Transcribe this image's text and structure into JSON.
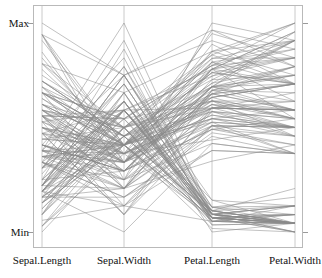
{
  "figure": {
    "title": "",
    "background_color": "#ffffff",
    "line_color": "#8a8a8a",
    "frame_color": "#b9b9b9",
    "axis_color": "#bdbdbd",
    "text_color": "#111111"
  },
  "axis_labels": {
    "max": "Max",
    "min": "Min"
  },
  "chart_data": {
    "type": "line",
    "subtype": "parallel-coordinates",
    "title": "",
    "xlabel": "",
    "ylabel": "",
    "grid": false,
    "legend": "none",
    "n_records": 150,
    "dimensions": [
      "Sepal.Length",
      "Sepal.Width",
      "Petal.Length",
      "Petal.Width"
    ],
    "axis_tick_labels": [
      "Min",
      "Max"
    ],
    "ylim": [
      0,
      1
    ],
    "note": "Each polyline is one Iris flower; values normalized per-axis to [Min,Max].",
    "dimension_ranges": [
      {
        "name": "Sepal.Length",
        "min": 4.3,
        "max": 7.9
      },
      {
        "name": "Sepal.Width",
        "min": 2.0,
        "max": 4.4
      },
      {
        "name": "Petal.Length",
        "min": 1.0,
        "max": 6.9
      },
      {
        "name": "Petal.Width",
        "min": 0.1,
        "max": 2.5
      }
    ],
    "records": [
      [
        5.1,
        3.5,
        1.4,
        0.2
      ],
      [
        4.9,
        3.0,
        1.4,
        0.2
      ],
      [
        4.7,
        3.2,
        1.3,
        0.2
      ],
      [
        4.6,
        3.1,
        1.5,
        0.2
      ],
      [
        5.0,
        3.6,
        1.4,
        0.2
      ],
      [
        5.4,
        3.9,
        1.7,
        0.4
      ],
      [
        4.6,
        3.4,
        1.4,
        0.3
      ],
      [
        5.0,
        3.4,
        1.5,
        0.2
      ],
      [
        4.4,
        2.9,
        1.4,
        0.2
      ],
      [
        4.9,
        3.1,
        1.5,
        0.1
      ],
      [
        5.4,
        3.7,
        1.5,
        0.2
      ],
      [
        4.8,
        3.4,
        1.6,
        0.2
      ],
      [
        4.8,
        3.0,
        1.4,
        0.1
      ],
      [
        4.3,
        3.0,
        1.1,
        0.1
      ],
      [
        5.8,
        4.0,
        1.2,
        0.2
      ],
      [
        5.7,
        4.4,
        1.5,
        0.4
      ],
      [
        5.4,
        3.9,
        1.3,
        0.4
      ],
      [
        5.1,
        3.5,
        1.4,
        0.3
      ],
      [
        5.7,
        3.8,
        1.7,
        0.3
      ],
      [
        5.1,
        3.8,
        1.5,
        0.3
      ],
      [
        5.4,
        3.4,
        1.7,
        0.2
      ],
      [
        5.1,
        3.7,
        1.5,
        0.4
      ],
      [
        4.6,
        3.6,
        1.0,
        0.2
      ],
      [
        5.1,
        3.3,
        1.7,
        0.5
      ],
      [
        4.8,
        3.4,
        1.9,
        0.2
      ],
      [
        5.0,
        3.0,
        1.6,
        0.2
      ],
      [
        5.0,
        3.4,
        1.6,
        0.4
      ],
      [
        5.2,
        3.5,
        1.5,
        0.2
      ],
      [
        5.2,
        3.4,
        1.4,
        0.2
      ],
      [
        4.7,
        3.2,
        1.6,
        0.2
      ],
      [
        4.8,
        3.1,
        1.6,
        0.2
      ],
      [
        5.4,
        3.4,
        1.5,
        0.4
      ],
      [
        5.2,
        4.1,
        1.5,
        0.1
      ],
      [
        5.5,
        4.2,
        1.4,
        0.2
      ],
      [
        4.9,
        3.1,
        1.5,
        0.2
      ],
      [
        5.0,
        3.2,
        1.2,
        0.2
      ],
      [
        5.5,
        3.5,
        1.3,
        0.2
      ],
      [
        4.9,
        3.6,
        1.4,
        0.1
      ],
      [
        4.4,
        3.0,
        1.3,
        0.2
      ],
      [
        5.1,
        3.4,
        1.5,
        0.2
      ],
      [
        5.0,
        3.5,
        1.3,
        0.3
      ],
      [
        4.5,
        2.3,
        1.3,
        0.3
      ],
      [
        4.4,
        3.2,
        1.3,
        0.2
      ],
      [
        5.0,
        3.5,
        1.6,
        0.6
      ],
      [
        5.1,
        3.8,
        1.9,
        0.4
      ],
      [
        4.8,
        3.0,
        1.4,
        0.3
      ],
      [
        5.1,
        3.8,
        1.6,
        0.2
      ],
      [
        4.6,
        3.2,
        1.4,
        0.2
      ],
      [
        5.3,
        3.7,
        1.5,
        0.2
      ],
      [
        5.0,
        3.3,
        1.4,
        0.2
      ],
      [
        7.0,
        3.2,
        4.7,
        1.4
      ],
      [
        6.4,
        3.2,
        4.5,
        1.5
      ],
      [
        6.9,
        3.1,
        4.9,
        1.5
      ],
      [
        5.5,
        2.3,
        4.0,
        1.3
      ],
      [
        6.5,
        2.8,
        4.6,
        1.5
      ],
      [
        5.7,
        2.8,
        4.5,
        1.3
      ],
      [
        6.3,
        3.3,
        4.7,
        1.6
      ],
      [
        4.9,
        2.4,
        3.3,
        1.0
      ],
      [
        6.6,
        2.9,
        4.6,
        1.3
      ],
      [
        5.2,
        2.7,
        3.9,
        1.4
      ],
      [
        5.0,
        2.0,
        3.5,
        1.0
      ],
      [
        5.9,
        3.0,
        4.2,
        1.5
      ],
      [
        6.0,
        2.2,
        4.0,
        1.0
      ],
      [
        6.1,
        2.9,
        4.7,
        1.4
      ],
      [
        5.6,
        2.9,
        3.6,
        1.3
      ],
      [
        6.7,
        3.1,
        4.4,
        1.4
      ],
      [
        5.6,
        3.0,
        4.5,
        1.5
      ],
      [
        5.8,
        2.7,
        4.1,
        1.0
      ],
      [
        6.2,
        2.2,
        4.5,
        1.5
      ],
      [
        5.6,
        2.5,
        3.9,
        1.1
      ],
      [
        5.9,
        3.2,
        4.8,
        1.8
      ],
      [
        6.1,
        2.8,
        4.0,
        1.3
      ],
      [
        6.3,
        2.5,
        4.9,
        1.5
      ],
      [
        6.1,
        2.8,
        4.7,
        1.2
      ],
      [
        6.4,
        2.9,
        4.3,
        1.3
      ],
      [
        6.6,
        3.0,
        4.4,
        1.4
      ],
      [
        6.8,
        2.8,
        4.8,
        1.4
      ],
      [
        6.7,
        3.0,
        5.0,
        1.7
      ],
      [
        6.0,
        2.9,
        4.5,
        1.5
      ],
      [
        5.7,
        2.6,
        3.5,
        1.0
      ],
      [
        5.5,
        2.4,
        3.8,
        1.1
      ],
      [
        5.5,
        2.4,
        3.7,
        1.0
      ],
      [
        5.8,
        2.7,
        3.9,
        1.2
      ],
      [
        6.0,
        2.7,
        5.1,
        1.6
      ],
      [
        5.4,
        3.0,
        4.5,
        1.5
      ],
      [
        6.0,
        3.4,
        4.5,
        1.6
      ],
      [
        6.7,
        3.1,
        4.7,
        1.5
      ],
      [
        6.3,
        2.3,
        4.4,
        1.3
      ],
      [
        5.6,
        3.0,
        4.1,
        1.3
      ],
      [
        5.5,
        2.5,
        4.0,
        1.3
      ],
      [
        5.5,
        2.6,
        4.4,
        1.2
      ],
      [
        6.1,
        3.0,
        4.6,
        1.4
      ],
      [
        5.8,
        2.6,
        4.0,
        1.2
      ],
      [
        5.0,
        2.3,
        3.3,
        1.0
      ],
      [
        5.6,
        2.7,
        4.2,
        1.3
      ],
      [
        5.7,
        3.0,
        4.2,
        1.2
      ],
      [
        5.7,
        2.9,
        4.2,
        1.3
      ],
      [
        6.2,
        2.9,
        4.3,
        1.3
      ],
      [
        5.1,
        2.5,
        3.0,
        1.1
      ],
      [
        5.7,
        2.8,
        4.1,
        1.3
      ],
      [
        6.3,
        3.3,
        6.0,
        2.5
      ],
      [
        5.8,
        2.7,
        5.1,
        1.9
      ],
      [
        7.1,
        3.0,
        5.9,
        2.1
      ],
      [
        6.3,
        2.9,
        5.6,
        1.8
      ],
      [
        6.5,
        3.0,
        5.8,
        2.2
      ],
      [
        7.6,
        3.0,
        6.6,
        2.1
      ],
      [
        4.9,
        2.5,
        4.5,
        1.7
      ],
      [
        7.3,
        2.9,
        6.3,
        1.8
      ],
      [
        6.7,
        2.5,
        5.8,
        1.8
      ],
      [
        7.2,
        3.6,
        6.1,
        2.5
      ],
      [
        6.5,
        3.2,
        5.1,
        2.0
      ],
      [
        6.4,
        2.7,
        5.3,
        1.9
      ],
      [
        6.8,
        3.0,
        5.5,
        2.1
      ],
      [
        5.7,
        2.5,
        5.0,
        2.0
      ],
      [
        5.8,
        2.8,
        5.1,
        2.4
      ],
      [
        6.4,
        3.2,
        5.3,
        2.3
      ],
      [
        6.5,
        3.0,
        5.5,
        1.8
      ],
      [
        7.7,
        3.8,
        6.7,
        2.2
      ],
      [
        7.7,
        2.6,
        6.9,
        2.3
      ],
      [
        6.0,
        2.2,
        5.0,
        1.5
      ],
      [
        6.9,
        3.2,
        5.7,
        2.3
      ],
      [
        5.6,
        2.8,
        4.9,
        2.0
      ],
      [
        7.7,
        2.8,
        6.7,
        2.0
      ],
      [
        6.3,
        2.7,
        4.9,
        1.8
      ],
      [
        6.7,
        3.3,
        5.7,
        2.1
      ],
      [
        7.2,
        3.2,
        6.0,
        1.8
      ],
      [
        6.2,
        2.8,
        4.8,
        1.8
      ],
      [
        6.1,
        3.0,
        4.9,
        1.8
      ],
      [
        6.4,
        2.8,
        5.6,
        2.1
      ],
      [
        7.2,
        3.0,
        5.8,
        1.6
      ],
      [
        7.4,
        2.8,
        6.1,
        1.9
      ],
      [
        7.9,
        3.8,
        6.4,
        2.0
      ],
      [
        6.4,
        2.8,
        5.6,
        2.2
      ],
      [
        6.3,
        2.8,
        5.1,
        1.5
      ],
      [
        6.1,
        2.6,
        5.6,
        1.4
      ],
      [
        7.7,
        3.0,
        6.1,
        2.3
      ],
      [
        6.3,
        3.4,
        5.6,
        2.4
      ],
      [
        6.4,
        3.1,
        5.5,
        1.8
      ],
      [
        6.0,
        3.0,
        4.8,
        1.8
      ],
      [
        6.9,
        3.1,
        5.4,
        2.1
      ],
      [
        6.7,
        3.1,
        5.6,
        2.4
      ],
      [
        6.9,
        3.1,
        5.1,
        2.3
      ],
      [
        5.8,
        2.7,
        5.1,
        1.9
      ],
      [
        6.8,
        3.2,
        5.9,
        2.3
      ],
      [
        6.7,
        3.3,
        5.7,
        2.5
      ],
      [
        6.7,
        3.0,
        5.2,
        2.3
      ],
      [
        6.3,
        2.5,
        5.0,
        1.9
      ],
      [
        6.5,
        3.0,
        5.2,
        2.0
      ],
      [
        6.2,
        3.4,
        5.4,
        2.3
      ],
      [
        5.9,
        3.0,
        5.1,
        1.8
      ]
    ]
  },
  "geometry": {
    "frame": {
      "x": 33,
      "y": 5,
      "width": 270,
      "height": 243
    },
    "axis_x": [
      42,
      124,
      212,
      295
    ],
    "y_max": 23,
    "y_min": 232
  }
}
